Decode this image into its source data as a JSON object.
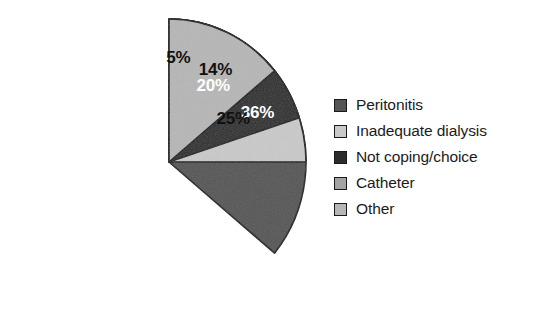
{
  "chart_data": {
    "type": "pie",
    "title": "",
    "subtitle": "",
    "xlabel": "",
    "ylabel": "",
    "grid": false,
    "legend_position": "right",
    "start_angle_deg": 0,
    "direction": "clockwise",
    "units": "percent",
    "categories": [
      "Peritonitis",
      "Inadequate dialysis",
      "Not coping/choice",
      "Catheter",
      "Other"
    ],
    "values": [
      36,
      25,
      20,
      5,
      14
    ],
    "data_labels": [
      "36%",
      "25%",
      "20%",
      "5%",
      "14%"
    ],
    "slice_colors": [
      "#555555",
      "#c9c9c9",
      "#2c2c2c",
      "#a3a3a3",
      "#b6b6b6"
    ],
    "label_text_colors": [
      "#ffffff",
      "#111111",
      "#ffffff",
      "#111111",
      "#111111"
    ],
    "outline_color": "#1a1a1a",
    "background": "#ffffff",
    "slices": [
      {
        "label": "Peritonitis",
        "value": 36,
        "data_label": "36%",
        "color": "#555555",
        "label_color": "#ffffff"
      },
      {
        "label": "Inadequate dialysis",
        "value": 25,
        "data_label": "25%",
        "color": "#c9c9c9",
        "label_color": "#111111"
      },
      {
        "label": "Not coping/choice",
        "value": 20,
        "data_label": "20%",
        "color": "#2c2c2c",
        "label_color": "#ffffff"
      },
      {
        "label": "Catheter",
        "value": 5,
        "data_label": "5%",
        "color": "#a3a3a3",
        "label_color": "#111111"
      },
      {
        "label": "Other",
        "value": 14,
        "data_label": "14%",
        "color": "#b6b6b6",
        "label_color": "#111111"
      }
    ]
  },
  "legend": {
    "items": [
      {
        "label": "Peritonitis",
        "color": "#555555"
      },
      {
        "label": "Inadequate dialysis",
        "color": "#c9c9c9"
      },
      {
        "label": "Not coping/choice",
        "color": "#2c2c2c"
      },
      {
        "label": "Catheter",
        "color": "#a3a3a3"
      },
      {
        "label": "Other",
        "color": "#b6b6b6"
      }
    ]
  }
}
